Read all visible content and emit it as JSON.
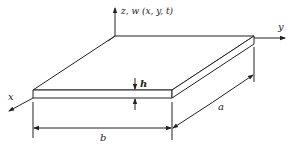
{
  "diagram": {
    "labels": {
      "z_axis": "z, w (x, y, t)",
      "y_axis": "y",
      "x_axis": "x",
      "thickness": "h",
      "width": "b",
      "length": "a"
    },
    "colors": {
      "stroke": "#222222",
      "background": "#ffffff"
    }
  }
}
